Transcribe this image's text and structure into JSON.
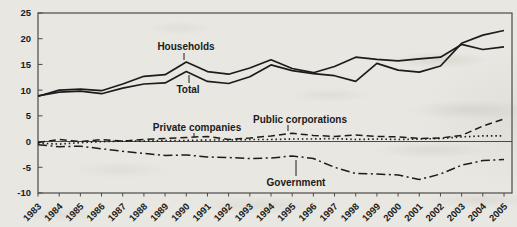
{
  "figure": {
    "background_color": "#e9e7e1",
    "line_color": "#1c1c1c",
    "axis_color": "#4b4a47"
  },
  "chart_data": {
    "type": "line",
    "x": [
      1983,
      1984,
      1985,
      1986,
      1987,
      1988,
      1989,
      1990,
      1991,
      1992,
      1993,
      1994,
      1995,
      1996,
      1997,
      1998,
      1999,
      2000,
      2001,
      2002,
      2003,
      2004,
      2005
    ],
    "series": [
      {
        "name": "Households",
        "style": "solid",
        "values": [
          8.8,
          10.0,
          10.2,
          9.9,
          11.2,
          12.7,
          13.0,
          15.5,
          13.6,
          13.1,
          14.3,
          15.9,
          14.2,
          13.4,
          14.6,
          16.4,
          16.0,
          15.7,
          16.1,
          16.4,
          18.9,
          17.9,
          18.4
        ]
      },
      {
        "name": "Total",
        "style": "solid",
        "values": [
          8.9,
          9.6,
          9.8,
          9.3,
          10.4,
          11.2,
          11.4,
          13.6,
          11.7,
          11.3,
          12.6,
          14.9,
          13.8,
          13.2,
          12.8,
          11.7,
          15.2,
          13.9,
          13.5,
          14.7,
          19.1,
          20.7,
          21.6
        ]
      },
      {
        "name": "Private companies",
        "style": "dashed",
        "values": [
          -0.2,
          0.4,
          0.0,
          0.4,
          0.1,
          0.4,
          0.6,
          0.8,
          1.0,
          0.4,
          0.7,
          1.1,
          1.6,
          1.2,
          1.0,
          1.3,
          1.0,
          0.9,
          0.6,
          0.7,
          1.2,
          3.0,
          4.4
        ]
      },
      {
        "name": "Public corporations",
        "style": "dotted",
        "values": [
          -0.3,
          -0.5,
          -0.2,
          0.0,
          0.1,
          0.1,
          0.2,
          0.2,
          0.3,
          0.3,
          0.4,
          0.4,
          0.5,
          0.5,
          0.6,
          0.4,
          0.5,
          0.4,
          0.5,
          0.6,
          0.9,
          1.1,
          1.1
        ]
      },
      {
        "name": "Government",
        "style": "dashdot",
        "values": [
          -0.6,
          -1.0,
          -0.9,
          -1.4,
          -1.9,
          -2.3,
          -2.7,
          -2.6,
          -3.0,
          -3.1,
          -3.3,
          -3.2,
          -2.8,
          -3.3,
          -5.0,
          -6.2,
          -6.3,
          -6.5,
          -7.4,
          -6.3,
          -4.6,
          -3.7,
          -3.5
        ]
      }
    ],
    "ylim": [
      -10,
      25
    ],
    "y_ticks": [
      25,
      20,
      15,
      10,
      5,
      0,
      -5,
      -10
    ],
    "xlabel": "",
    "ylabel": "",
    "title": "",
    "grid": "off",
    "legend": "inline-labels"
  }
}
